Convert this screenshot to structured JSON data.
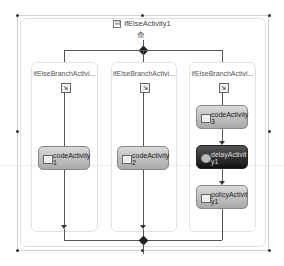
{
  "diagram": {
    "title": "ifElseActivity1",
    "expand_glyph": "⊟",
    "branches": [
      {
        "label": "ifElseBranchActivi...",
        "activities": [
          {
            "label": "codeActivity 1",
            "line1": "codeActivity",
            "line2": "1",
            "type": "code"
          }
        ]
      },
      {
        "label": "ifElseBranchActivi...",
        "activities": [
          {
            "label": "codeActivity 2",
            "line1": "codeActivity",
            "line2": "2",
            "type": "code"
          }
        ]
      },
      {
        "label": "ifElseBranchActivi...",
        "activities": [
          {
            "label": "codeActivity 3",
            "line1": "codeActivity",
            "line2": "3",
            "type": "code"
          },
          {
            "label": "delayActivity1",
            "line1": "delayActivit",
            "line2": "y1",
            "type": "delay",
            "selected": true
          },
          {
            "label": "policyActivity1",
            "line1": "policyActivit",
            "line2": "y1",
            "type": "policy"
          }
        ]
      }
    ]
  }
}
